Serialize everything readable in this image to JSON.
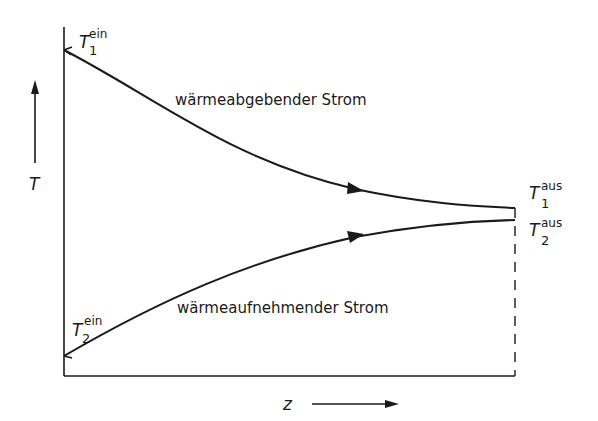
{
  "diagram": {
    "type": "temperature-profile",
    "axes": {
      "y_label": "T",
      "x_label": "z"
    },
    "streams": [
      {
        "name": "wärmeabgebender Strom",
        "inlet": {
          "symbol": "T",
          "subscript": "1",
          "superscript": "ein"
        },
        "outlet": {
          "symbol": "T",
          "subscript": "1",
          "superscript": "aus"
        }
      },
      {
        "name": "wärmeaufnehmender Strom",
        "inlet": {
          "symbol": "T",
          "subscript": "2",
          "superscript": "ein"
        },
        "outlet": {
          "symbol": "T",
          "subscript": "2",
          "superscript": "aus"
        }
      }
    ],
    "line_color": "#1a1a1a"
  }
}
